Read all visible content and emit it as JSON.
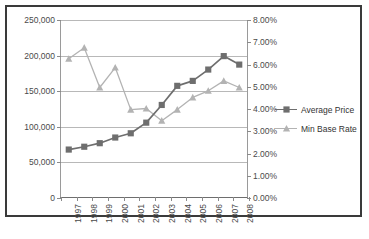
{
  "chart_data": {
    "type": "line",
    "title": "",
    "categories": [
      "1997",
      "1998",
      "1999",
      "2000",
      "2001",
      "2002",
      "2003",
      "2004",
      "2005",
      "2006",
      "2007",
      "2008"
    ],
    "series": [
      {
        "name": "Average Price",
        "axis": "left",
        "marker": "square",
        "color": "#6e6e6e",
        "values": [
          67000,
          71000,
          76000,
          84000,
          90000,
          105000,
          130000,
          157000,
          164000,
          180000,
          199000,
          187000
        ]
      },
      {
        "name": "Min Base Rate",
        "axis": "right",
        "marker": "triangle",
        "color": "#b3b3b3",
        "values": [
          0.0625,
          0.0675,
          0.0495,
          0.0585,
          0.0395,
          0.04,
          0.0345,
          0.0395,
          0.045,
          0.048,
          0.0525,
          0.0495
        ]
      }
    ],
    "left_axis": {
      "ticks": [
        "0",
        "50,000",
        "100,000",
        "150,000",
        "200,000",
        "250,000"
      ],
      "values": [
        0,
        50000,
        100000,
        150000,
        200000,
        250000
      ],
      "min": 0,
      "max": 250000
    },
    "right_axis": {
      "ticks": [
        "0.00%",
        "1.00%",
        "2.00%",
        "3.00%",
        "4.00%",
        "5.00%",
        "6.00%",
        "7.00%",
        "8.00%"
      ],
      "values": [
        0,
        0.01,
        0.02,
        0.03,
        0.04,
        0.05,
        0.06,
        0.07,
        0.08
      ],
      "min": 0,
      "max": 0.08
    },
    "xlabel": "",
    "ylabel": "",
    "grid": true,
    "legend_position": "right"
  },
  "legend": {
    "items": [
      {
        "label": "Average Price"
      },
      {
        "label": "Min Base Rate"
      }
    ]
  }
}
